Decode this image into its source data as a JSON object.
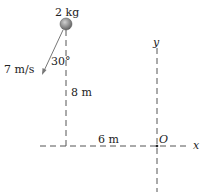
{
  "diagram": {
    "mass_label": "2 kg",
    "velocity_label": "7 m/s",
    "angle_label": "30°",
    "height_label": "8 m",
    "distance_label": "6 m",
    "origin_label": "O",
    "x_axis_label": "x",
    "y_axis_label": "y"
  },
  "physics": {
    "mass_kg": 2,
    "speed_m_per_s": 7,
    "angle_from_vertical_deg": 30,
    "height_m": 8,
    "horizontal_distance_m": 6
  }
}
